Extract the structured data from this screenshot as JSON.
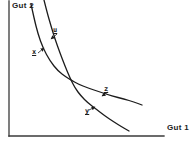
{
  "diagram": {
    "type": "line",
    "axis_labels": {
      "y": "Gut 2",
      "x": "Gut 1"
    },
    "point_labels": {
      "u": "u",
      "x": "x",
      "z": "z",
      "y": "y"
    },
    "colors": {
      "background": "#ffffff",
      "line": "#1c1c1c",
      "axis": "#3a3a3a"
    },
    "axes": {
      "origin": [
        9,
        136
      ],
      "x_end": [
        164,
        136
      ],
      "y_end": [
        9,
        1
      ]
    },
    "curves": [
      {
        "name": "curve-through-x-and-z",
        "points": [
          [
            31,
            4
          ],
          [
            34,
            18
          ],
          [
            38,
            34
          ],
          [
            43,
            48
          ],
          [
            50,
            61
          ],
          [
            58,
            71
          ],
          [
            66,
            77
          ],
          [
            71,
            80
          ],
          [
            78,
            84
          ],
          [
            88,
            88
          ],
          [
            100,
            92
          ],
          [
            112,
            96
          ],
          [
            124,
            99
          ],
          [
            134,
            102
          ],
          [
            142,
            105
          ]
        ]
      },
      {
        "name": "curve-through-u-and-y",
        "points": [
          [
            44,
            0
          ],
          [
            47,
            12
          ],
          [
            51,
            26
          ],
          [
            55,
            39
          ],
          [
            60,
            53
          ],
          [
            65,
            66
          ],
          [
            70,
            78
          ],
          [
            75,
            88
          ],
          [
            81,
            96
          ],
          [
            88,
            103
          ],
          [
            96,
            109
          ],
          [
            105,
            116
          ],
          [
            114,
            122
          ],
          [
            122,
            127
          ],
          [
            129,
            131
          ]
        ]
      }
    ],
    "arrows": [
      {
        "label": "u",
        "from": [
          57,
          34
        ],
        "to": [
          51,
          39
        ]
      },
      {
        "label": "x",
        "from": [
          38,
          53
        ],
        "to": [
          44,
          48
        ]
      },
      {
        "label": "z",
        "from": [
          108,
          92
        ],
        "to": [
          102,
          96
        ]
      },
      {
        "label": "y",
        "from": [
          89,
          110
        ],
        "to": [
          95,
          107
        ]
      }
    ]
  }
}
